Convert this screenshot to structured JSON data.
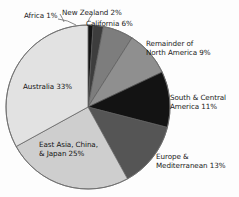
{
  "chart_data": {
    "type": "pie",
    "title": "",
    "subtitle": "",
    "xlabel": "",
    "ylabel": "",
    "legend_position": "none",
    "grid": false,
    "start_angle_deg": 0,
    "direction": "clockwise",
    "categories": [
      "Africa",
      "New Zealand",
      "California",
      "Remainder of North America",
      "South & Central America",
      "Europe & Mediterranean",
      "East Asia, China, & Japan",
      "Australia"
    ],
    "values": [
      1,
      2,
      6,
      9,
      11,
      13,
      25,
      33
    ],
    "unit": "%",
    "slices": [
      {
        "name": "Africa",
        "value": 1,
        "label": "Africa 1%",
        "color": "#141414",
        "label_position": "outside-left",
        "has_leader_line": true
      },
      {
        "name": "New Zealand",
        "value": 2,
        "label": "New Zealand 2%",
        "color": "#3d3d3d",
        "label_position": "outside-top",
        "has_leader_line": true
      },
      {
        "name": "California",
        "value": 6,
        "label": "California 6%",
        "color": "#7d7d7d",
        "label_position": "outside-top-right",
        "has_leader_line": false
      },
      {
        "name": "Remainder of North America",
        "value": 9,
        "label": "Remainder of\nNorth America 9%",
        "label_line1": "Remainder of",
        "label_line2": "North America 9%",
        "color": "#8f8f8f",
        "label_position": "outside-right",
        "has_leader_line": false
      },
      {
        "name": "South & Central America",
        "value": 11,
        "label": "South & Central\nAmerica 11%",
        "label_line1": "South & Central",
        "label_line2": "America 11%",
        "color": "#131313",
        "label_position": "outside-right",
        "has_leader_line": false
      },
      {
        "name": "Europe & Mediterranean",
        "value": 13,
        "label": "Europe &\nMediterranean 13%",
        "label_line1": "Europe &",
        "label_line2": "Mediterranean 13%",
        "color": "#555555",
        "label_position": "outside-bottom-right",
        "has_leader_line": false
      },
      {
        "name": "East Asia, China, & Japan",
        "value": 25,
        "label": "East Asia, China,\n& Japan 25%",
        "label_line1": "East Asia, China,",
        "label_line2": "& Japan 25%",
        "color": "#cecece",
        "label_position": "inside",
        "has_leader_line": false
      },
      {
        "name": "Australia",
        "value": 33,
        "label": "Australia 33%",
        "color": "#e2e2e2",
        "label_position": "inside",
        "has_leader_line": false
      }
    ]
  },
  "labels": {
    "africa": "Africa 1%",
    "new_zealand": "New Zealand 2%",
    "california": "California 6%",
    "remainder_line1": "Remainder of",
    "remainder_line2": "North America 9%",
    "south_central_line1": "South & Central",
    "south_central_line2": "America 11%",
    "europe_line1": "Europe &",
    "europe_line2": "Mediterranean 13%",
    "east_asia_line1": "East Asia, China,",
    "east_asia_line2": "& Japan 25%",
    "australia": "Australia 33%"
  },
  "colors": {
    "background": "#fdfdfd",
    "outline": "#5a5a5a",
    "text": "#1b1b1b",
    "leader_line": "#6b6b6b"
  }
}
